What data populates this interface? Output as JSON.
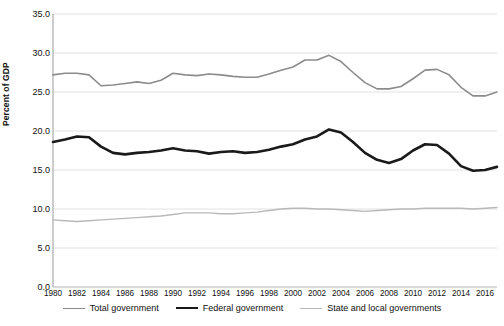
{
  "chart_data": {
    "type": "line",
    "title": "",
    "xlabel": "",
    "ylabel": "Percent of GDP",
    "ylim": [
      0.0,
      35.0
    ],
    "ytick_values": [
      0.0,
      5.0,
      10.0,
      15.0,
      20.0,
      25.0,
      30.0,
      35.0
    ],
    "ytick_labels": [
      "0.0",
      "5.0",
      "10.0",
      "15.0",
      "20.0",
      "25.0",
      "30.0",
      "35.0"
    ],
    "xlim": [
      1980,
      2017
    ],
    "xtick_values": [
      1980,
      1982,
      1984,
      1986,
      1988,
      1990,
      1992,
      1994,
      1996,
      1998,
      2000,
      2002,
      2004,
      2006,
      2008,
      2010,
      2012,
      2014,
      2016
    ],
    "xtick_labels": [
      "1980",
      "1982",
      "1984",
      "1986",
      "1988",
      "1990",
      "1992",
      "1994",
      "1996",
      "1998",
      "2000",
      "2002",
      "2004",
      "2006",
      "2008",
      "2010",
      "2012",
      "2014",
      "2016"
    ],
    "grid": "horizontal",
    "legend_position": "bottom",
    "x": [
      1980,
      1981,
      1982,
      1983,
      1984,
      1985,
      1986,
      1987,
      1988,
      1989,
      1990,
      1991,
      1992,
      1993,
      1994,
      1995,
      1996,
      1997,
      1998,
      1999,
      2000,
      2001,
      2002,
      2003,
      2004,
      2005,
      2006,
      2007,
      2008,
      2009,
      2010,
      2011,
      2012,
      2013,
      2014,
      2015,
      2016,
      2017
    ],
    "series": [
      {
        "name": "Total government",
        "color": "#8c8c8c",
        "width": 1.6,
        "values": [
          27.2,
          27.4,
          27.4,
          27.2,
          25.8,
          25.9,
          26.1,
          26.3,
          26.1,
          26.5,
          27.4,
          27.2,
          27.1,
          27.3,
          27.2,
          27.0,
          26.9,
          26.9,
          27.3,
          27.8,
          28.2,
          29.1,
          29.1,
          29.7,
          28.9,
          27.5,
          26.2,
          25.4,
          25.4,
          25.7,
          26.7,
          27.8,
          27.9,
          27.2,
          25.6,
          24.5,
          24.5,
          25.0
        ]
      },
      {
        "name": "Federal government",
        "color": "#1a1a1a",
        "width": 2.6,
        "values": [
          18.6,
          18.9,
          19.3,
          19.2,
          18.0,
          17.2,
          17.0,
          17.2,
          17.3,
          17.5,
          17.8,
          17.5,
          17.4,
          17.1,
          17.3,
          17.4,
          17.2,
          17.3,
          17.6,
          18.0,
          18.3,
          18.9,
          19.3,
          20.2,
          19.8,
          18.6,
          17.2,
          16.3,
          15.9,
          16.4,
          17.5,
          18.3,
          18.2,
          17.1,
          15.5,
          14.9,
          15.0,
          15.4
        ]
      },
      {
        "name": "State and local governments",
        "color": "#b9b9b9",
        "width": 1.4,
        "values": [
          8.6,
          8.5,
          8.4,
          8.5,
          8.6,
          8.7,
          8.8,
          8.9,
          9.0,
          9.1,
          9.3,
          9.5,
          9.5,
          9.5,
          9.4,
          9.4,
          9.5,
          9.6,
          9.8,
          10.0,
          10.1,
          10.1,
          10.0,
          10.0,
          9.9,
          9.8,
          9.7,
          9.8,
          9.9,
          10.0,
          10.0,
          10.1,
          10.1,
          10.1,
          10.1,
          10.0,
          10.1,
          10.2
        ]
      }
    ]
  },
  "axis": {
    "ylabel": "Percent of GDP"
  },
  "legend": {
    "items": [
      {
        "label": "Total government"
      },
      {
        "label": "Federal government"
      },
      {
        "label": "State and local governments"
      }
    ]
  },
  "footnote": {
    "text": ""
  }
}
